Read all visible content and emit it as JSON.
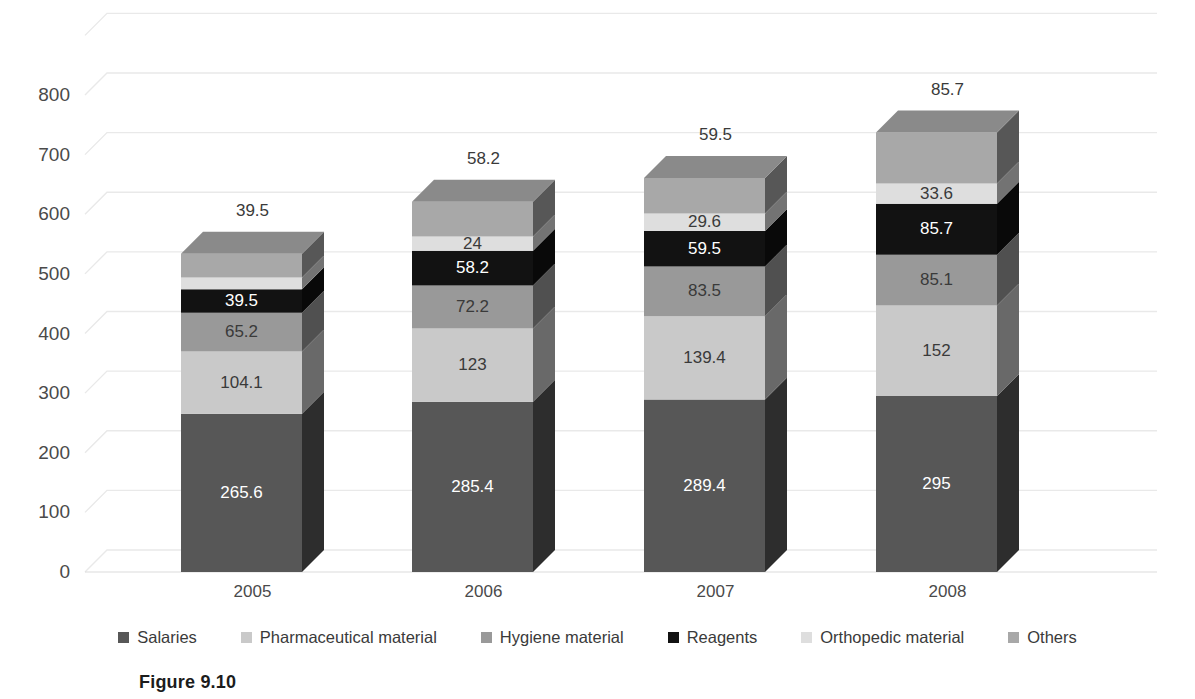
{
  "figure": {
    "caption": "Figure 9.10"
  },
  "chart_data": {
    "type": "bar",
    "subtype": "stacked-3d-column",
    "title": "",
    "xlabel": "",
    "ylabel": "",
    "categories": [
      "2005",
      "2006",
      "2007",
      "2008"
    ],
    "yticks": [
      "0",
      "100",
      "200",
      "300",
      "400",
      "500",
      "600",
      "700",
      "800"
    ],
    "ylim": [
      0,
      800
    ],
    "grid": true,
    "legend_position": "bottom",
    "series": [
      {
        "name": "Salaries",
        "color": "#575757",
        "values": [
          265.6,
          285.4,
          289.4,
          295
        ],
        "labels": [
          "265.6",
          "285.4",
          "289.4",
          "295"
        ],
        "label_style": "dark"
      },
      {
        "name": "Pharmaceutical material",
        "color": "#c9c9c9",
        "values": [
          104.1,
          123,
          139.4,
          152
        ],
        "labels": [
          "104.1",
          "123",
          "139.4",
          "152"
        ],
        "label_style": "light"
      },
      {
        "name": "Hygiene material",
        "color": "#999999",
        "values": [
          65.2,
          72.2,
          83.5,
          85.1
        ],
        "labels": [
          "65.2",
          "72.2",
          "83.5",
          "85.1"
        ],
        "label_style": "light"
      },
      {
        "name": "Reagents",
        "color": "#121212",
        "values": [
          39.5,
          58.2,
          59.5,
          85.7
        ],
        "labels": [
          "39.5",
          "58.2",
          "59.5",
          "85.7"
        ],
        "label_style": "dark"
      },
      {
        "name": "Orthopedic material",
        "color": "#dedede",
        "values": [
          19.7,
          24,
          29.6,
          33.6
        ],
        "labels": [
          "19.7",
          "24",
          "29.6",
          "33.6"
        ],
        "label_style": "light"
      },
      {
        "name": "Others",
        "color": "#a8a8a8",
        "values": [
          39.5,
          58.2,
          59.5,
          85.7
        ],
        "labels": [
          "39.5",
          "58.2",
          "59.5",
          "85.7"
        ],
        "label_style": "light",
        "label_above_bar": true
      }
    ],
    "totals": [
      533.6,
      621.0,
      660.9,
      737.1
    ],
    "top_labels": [
      "39.5",
      "58.2",
      "59.5",
      "85.7"
    ]
  }
}
